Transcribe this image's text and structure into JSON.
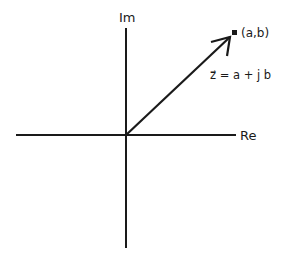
{
  "diagram": {
    "axes": {
      "imaginary_label": "Im",
      "real_label": "Re"
    },
    "point": {
      "label": "(a,b)"
    },
    "vector": {
      "formula": "z⃗ = a + j b"
    },
    "colors": {
      "stroke": "#1a1a1a",
      "background": "#ffffff"
    }
  }
}
